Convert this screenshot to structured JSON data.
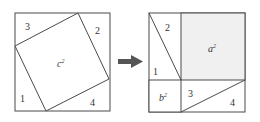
{
  "diagram": {
    "colors": {
      "stroke": "#4a4a4a",
      "shaded_fill": "#f0f0f0",
      "arrow": "#555555",
      "text": "#333333"
    },
    "left_square": {
      "labels": {
        "t1": "1",
        "t2": "2",
        "t3": "3",
        "t4": "4",
        "center_base": "c",
        "center_exp": "2"
      }
    },
    "arrow": {
      "icon": "right-arrow-icon"
    },
    "right_square": {
      "labels": {
        "t1": "1",
        "t2": "2",
        "t3": "3",
        "t4": "4",
        "a_base": "a",
        "a_exp": "2",
        "b_base": "b",
        "b_exp": "2"
      }
    }
  }
}
